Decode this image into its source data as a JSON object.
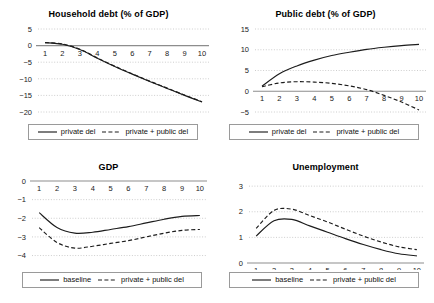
{
  "figure": {
    "panel_count": 4,
    "layout": "2x2"
  },
  "panels": [
    {
      "key": "household_debt",
      "title": "Household debt (% of GDP)",
      "legend": [
        {
          "label": "private del",
          "style": "solid"
        },
        {
          "label": "private + public del",
          "style": "dashed"
        }
      ]
    },
    {
      "key": "public_debt",
      "title": "Public debt (% of GDP)",
      "legend": [
        {
          "label": "private del",
          "style": "solid"
        },
        {
          "label": "private + public del",
          "style": "dashed"
        }
      ]
    },
    {
      "key": "gdp",
      "title": "GDP",
      "legend": [
        {
          "label": "baseline",
          "style": "solid"
        },
        {
          "label": "private + public del",
          "style": "dashed"
        }
      ]
    },
    {
      "key": "unemployment",
      "title": "Unemployment",
      "legend": [
        {
          "label": "baseline",
          "style": "solid"
        },
        {
          "label": "private + public del",
          "style": "dashed"
        }
      ]
    }
  ],
  "chart_data": [
    {
      "type": "line",
      "title": "Household debt (% of GDP)",
      "xlabel": "",
      "ylabel": "",
      "x": [
        1,
        2,
        3,
        4,
        5,
        6,
        7,
        8,
        9,
        10
      ],
      "xticklabels": [
        "1",
        "2",
        "3",
        "4",
        "5",
        "6",
        "7",
        "8",
        "9",
        "10"
      ],
      "yticklabels": [
        "5",
        "0",
        "-5",
        "-10",
        "-15",
        "-20"
      ],
      "ylim": [
        -20,
        5
      ],
      "xlim": [
        0.6,
        10.4
      ],
      "grid": true,
      "legend_position": "below",
      "series": [
        {
          "name": "private del",
          "style": "solid",
          "values": [
            0.9,
            0.4,
            -1.2,
            -3.8,
            -6.3,
            -8.6,
            -10.8,
            -12.9,
            -15.0,
            -17.0
          ]
        },
        {
          "name": "private + public del",
          "style": "dashed",
          "values": [
            0.9,
            0.5,
            -1.1,
            -3.7,
            -6.2,
            -8.5,
            -10.7,
            -12.8,
            -14.9,
            -16.9
          ]
        }
      ]
    },
    {
      "type": "line",
      "title": "Public debt (% of GDP)",
      "xlabel": "",
      "ylabel": "",
      "x": [
        1,
        2,
        3,
        4,
        5,
        6,
        7,
        8,
        9,
        10
      ],
      "xticklabels": [
        "1",
        "2",
        "3",
        "4",
        "5",
        "6",
        "7",
        "8",
        "9",
        "10"
      ],
      "yticklabels": [
        "15",
        "10",
        "5",
        "0",
        "-5"
      ],
      "ylim": [
        -5,
        15
      ],
      "xlim": [
        0.6,
        10.4
      ],
      "grid": true,
      "legend_position": "below",
      "series": [
        {
          "name": "private del",
          "style": "solid",
          "values": [
            1.2,
            4.2,
            6.1,
            7.5,
            8.6,
            9.4,
            10.1,
            10.6,
            11.0,
            11.3
          ]
        },
        {
          "name": "private + public del",
          "style": "dashed",
          "values": [
            1.1,
            2.0,
            2.3,
            2.2,
            1.9,
            1.3,
            0.4,
            -1.0,
            -2.6,
            -4.5
          ]
        }
      ]
    },
    {
      "type": "line",
      "title": "GDP",
      "xlabel": "",
      "ylabel": "",
      "x": [
        1,
        2,
        3,
        4,
        5,
        6,
        7,
        8,
        9,
        10
      ],
      "xticklabels": [
        "1",
        "2",
        "3",
        "4",
        "5",
        "6",
        "7",
        "8",
        "9",
        "10"
      ],
      "yticklabels": [
        "0",
        "-1",
        "-2",
        "-3",
        "-4"
      ],
      "ylim": [
        -4.4,
        0
      ],
      "xlim": [
        0.6,
        10.4
      ],
      "grid": true,
      "legend_position": "below",
      "series": [
        {
          "name": "baseline",
          "style": "solid",
          "values": [
            -1.7,
            -2.5,
            -2.8,
            -2.75,
            -2.6,
            -2.45,
            -2.25,
            -2.05,
            -1.9,
            -1.85
          ]
        },
        {
          "name": "private + public del",
          "style": "dashed",
          "values": [
            -2.5,
            -3.3,
            -3.6,
            -3.5,
            -3.35,
            -3.2,
            -3.0,
            -2.8,
            -2.65,
            -2.6
          ]
        }
      ]
    },
    {
      "type": "line",
      "title": "Unemployment",
      "xlabel": "",
      "ylabel": "",
      "x": [
        1,
        2,
        3,
        4,
        5,
        6,
        7,
        8,
        9,
        10
      ],
      "xticklabels": [
        "1",
        "2",
        "3",
        "4",
        "5",
        "6",
        "7",
        "8",
        "9",
        "10"
      ],
      "yticklabels": [
        "3",
        "2",
        "1",
        "0"
      ],
      "ylim": [
        0,
        3.2
      ],
      "xlim": [
        0.6,
        10.4
      ],
      "grid": true,
      "legend_position": "below",
      "series": [
        {
          "name": "baseline",
          "style": "solid",
          "values": [
            1.05,
            1.65,
            1.7,
            1.45,
            1.2,
            0.95,
            0.72,
            0.52,
            0.36,
            0.28
          ]
        },
        {
          "name": "private + public del",
          "style": "dashed",
          "values": [
            1.35,
            2.05,
            2.1,
            1.85,
            1.6,
            1.32,
            1.05,
            0.82,
            0.63,
            0.52
          ]
        }
      ]
    }
  ],
  "colors": {
    "line": "#1c1c1c",
    "grid": "#b8b8b8",
    "axis": "#8d8d8d",
    "text": "#000000",
    "background": "#ffffff"
  }
}
